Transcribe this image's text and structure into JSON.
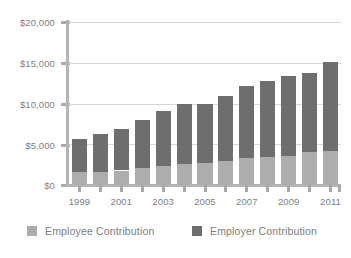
{
  "chart_data": {
    "type": "bar",
    "subtype": "stacked-vertical",
    "title": "",
    "subtitle": "",
    "xlabel": "",
    "ylabel": "",
    "ylim": [
      0,
      20000
    ],
    "y_ticks": [
      0,
      5000,
      10000,
      15000,
      20000
    ],
    "y_tick_labels": [
      "$0",
      "$5,000",
      "$10,000",
      "$15,000",
      "$20,000"
    ],
    "grid": true,
    "grid_axis": "y",
    "legend_position": "bottom",
    "categories": [
      "1999",
      "2000",
      "2001",
      "2002",
      "2003",
      "2004",
      "2005",
      "2006",
      "2007",
      "2008",
      "2009",
      "2010",
      "2011"
    ],
    "x_tick_labels_shown": [
      "1999",
      "2001",
      "2003",
      "2005",
      "2007",
      "2009",
      "2011"
    ],
    "series": [
      {
        "name": "Employee Contribution",
        "color": "#adadad",
        "values": [
          1550,
          1620,
          1780,
          2080,
          2350,
          2600,
          2740,
          2960,
          3300,
          3400,
          3520,
          3990,
          4130
        ]
      },
      {
        "name": "Employer Contribution",
        "color": "#6e6e6e",
        "values": [
          4100,
          4610,
          5130,
          5840,
          6710,
          7400,
          7260,
          7960,
          8880,
          9320,
          9880,
          9810,
          10970
        ]
      }
    ],
    "totals": [
      5650,
      6230,
      6910,
      7920,
      9060,
      10000,
      10000,
      10920,
      12180,
      12720,
      13400,
      13800,
      15100
    ]
  },
  "legend": {
    "items": [
      {
        "label": "Employee Contribution",
        "color": "#adadad"
      },
      {
        "label": "Employer Contribution",
        "color": "#6e6e6e"
      }
    ]
  },
  "axes": {
    "y": {
      "labels": [
        "$20,000",
        "$15,000",
        "$10,000",
        "$5,000",
        "$0"
      ]
    },
    "x": {
      "labels": [
        "1999",
        "2001",
        "2003",
        "2005",
        "2007",
        "2009",
        "2011"
      ]
    }
  }
}
